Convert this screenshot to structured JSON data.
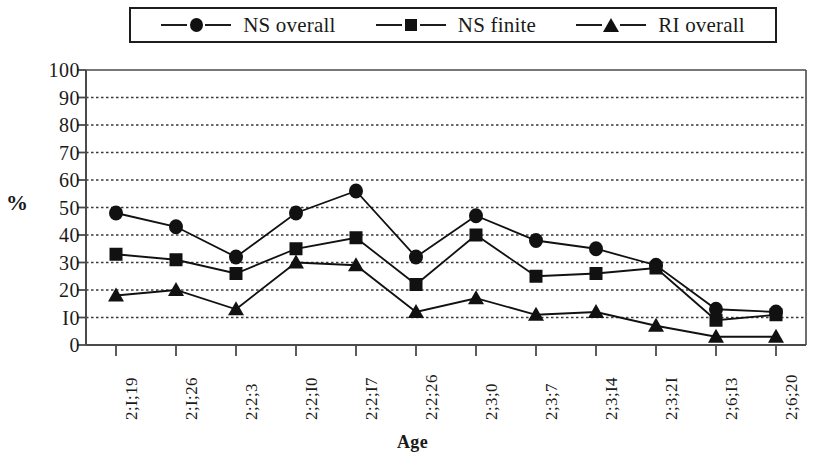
{
  "chart_data": {
    "type": "line",
    "title": "",
    "xlabel": "Age",
    "ylabel": "%",
    "ylim": [
      0,
      100
    ],
    "ytick_labels": [
      "100",
      "90",
      "80",
      "70",
      "60",
      "50",
      "40",
      "30",
      "20",
      "I0",
      "0"
    ],
    "ytick_values": [
      100,
      90,
      80,
      70,
      60,
      50,
      40,
      30,
      20,
      10,
      0
    ],
    "grid": true,
    "grid_style": "dotted-horizontal",
    "legend_position": "top-center",
    "categories": [
      "2;I;19",
      "2;I;26",
      "2;2;3",
      "2;2;I0",
      "2;2;I7",
      "2;2;26",
      "2;3;0",
      "2;3;7",
      "2;3;I4",
      "2;3;2I",
      "2;6;I3",
      "2;6;20"
    ],
    "series": [
      {
        "name": "NS overall",
        "marker": "circle",
        "color": "#111111",
        "values": [
          48,
          43,
          32,
          48,
          56,
          32,
          47,
          38,
          35,
          29,
          13,
          12
        ]
      },
      {
        "name": "NS finite",
        "marker": "square",
        "color": "#111111",
        "values": [
          33,
          31,
          26,
          35,
          39,
          22,
          40,
          25,
          26,
          28,
          9,
          11
        ]
      },
      {
        "name": "RI overall",
        "marker": "triangle",
        "color": "#111111",
        "values": [
          18,
          20,
          13,
          30,
          29,
          12,
          17,
          11,
          12,
          7,
          3,
          3
        ]
      }
    ]
  },
  "legend": {
    "entries": [
      {
        "label": "NS overall",
        "marker": "circle"
      },
      {
        "label": "NS finite",
        "marker": "square"
      },
      {
        "label": "RI overall",
        "marker": "triangle"
      }
    ]
  },
  "axes": {
    "x_title": "Age",
    "y_title": "%"
  },
  "colors": {
    "ink": "#111111",
    "axis": "#4a4a4a",
    "grid": "#3a3a3a",
    "background": "#ffffff"
  }
}
